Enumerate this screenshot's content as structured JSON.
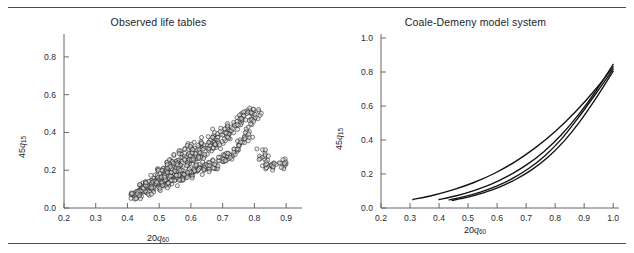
{
  "figure": {
    "caption_fragment": "",
    "top_rule": true,
    "bottom_rule": true
  },
  "panels": [
    {
      "id": "observed-life-tables",
      "title": "Observed life tables",
      "xlabel_pre": "20",
      "xlabel_var": "q",
      "xlabel_sub": "60",
      "ylabel_pre": "45",
      "ylabel_var": "q",
      "ylabel_sub": "15",
      "xticks": [
        "0.2",
        "0.3",
        "0.4",
        "0.5",
        "0.6",
        "0.7",
        "0.8",
        "0.9"
      ],
      "yticks": [
        "0.0",
        "0.2",
        "0.4",
        "0.6",
        "0.8"
      ]
    },
    {
      "id": "coale-demeny-model-system",
      "title": "Coale-Demeny model system",
      "xlabel_pre": "20",
      "xlabel_var": "q",
      "xlabel_sub": "60",
      "ylabel_pre": "45",
      "ylabel_var": "q",
      "ylabel_sub": "15",
      "xticks": [
        "0.2",
        "0.3",
        "0.4",
        "0.5",
        "0.6",
        "0.7",
        "0.8",
        "0.9",
        "1.0"
      ],
      "yticks": [
        "0.0",
        "0.2",
        "0.4",
        "0.6",
        "0.8",
        "1.0"
      ]
    }
  ],
  "chart_data": [
    {
      "type": "scatter",
      "title": "Observed life tables",
      "xlabel": "20q60",
      "ylabel": "45q15",
      "xlim": [
        0.2,
        0.95
      ],
      "ylim": [
        0.0,
        0.9
      ],
      "xticks": [
        0.2,
        0.3,
        0.4,
        0.5,
        0.6,
        0.7,
        0.8,
        0.9
      ],
      "yticks": [
        0.0,
        0.2,
        0.4,
        0.6,
        0.8
      ],
      "grid": false,
      "legend": null,
      "marker": "open-circle",
      "n_points": 620,
      "description": "Dense positively-correlated cloud of observed life-table pairs rising from about (0.42, 0.06) to about (0.80, 0.50), with a handful of outliers near x = 0.85-0.90 at y = 0.22-0.30.",
      "points_envelope": {
        "x_min": 0.41,
        "x_max": 0.9,
        "y_min": 0.05,
        "y_max": 0.53,
        "trend_slope": 0.95,
        "trend_intercept": -0.36
      },
      "points": [
        [
          0.42,
          0.07
        ],
        [
          0.43,
          0.07
        ],
        [
          0.44,
          0.08
        ],
        [
          0.44,
          0.1
        ],
        [
          0.45,
          0.08
        ],
        [
          0.45,
          0.11
        ],
        [
          0.46,
          0.09
        ],
        [
          0.46,
          0.12
        ],
        [
          0.47,
          0.1
        ],
        [
          0.47,
          0.13
        ],
        [
          0.48,
          0.11
        ],
        [
          0.48,
          0.14
        ],
        [
          0.49,
          0.11
        ],
        [
          0.49,
          0.15
        ],
        [
          0.5,
          0.12
        ],
        [
          0.5,
          0.16
        ],
        [
          0.5,
          0.2
        ],
        [
          0.51,
          0.13
        ],
        [
          0.51,
          0.17
        ],
        [
          0.52,
          0.13
        ],
        [
          0.52,
          0.18
        ],
        [
          0.52,
          0.22
        ],
        [
          0.53,
          0.14
        ],
        [
          0.53,
          0.19
        ],
        [
          0.54,
          0.15
        ],
        [
          0.54,
          0.2
        ],
        [
          0.54,
          0.24
        ],
        [
          0.55,
          0.15
        ],
        [
          0.55,
          0.21
        ],
        [
          0.55,
          0.26
        ],
        [
          0.56,
          0.16
        ],
        [
          0.56,
          0.22
        ],
        [
          0.57,
          0.17
        ],
        [
          0.57,
          0.23
        ],
        [
          0.57,
          0.28
        ],
        [
          0.58,
          0.17
        ],
        [
          0.58,
          0.24
        ],
        [
          0.59,
          0.18
        ],
        [
          0.59,
          0.25
        ],
        [
          0.59,
          0.3
        ],
        [
          0.6,
          0.19
        ],
        [
          0.6,
          0.26
        ],
        [
          0.6,
          0.32
        ],
        [
          0.61,
          0.19
        ],
        [
          0.61,
          0.27
        ],
        [
          0.62,
          0.2
        ],
        [
          0.62,
          0.28
        ],
        [
          0.62,
          0.33
        ],
        [
          0.63,
          0.21
        ],
        [
          0.63,
          0.29
        ],
        [
          0.64,
          0.21
        ],
        [
          0.64,
          0.3
        ],
        [
          0.64,
          0.35
        ],
        [
          0.65,
          0.22
        ],
        [
          0.65,
          0.31
        ],
        [
          0.66,
          0.23
        ],
        [
          0.66,
          0.32
        ],
        [
          0.66,
          0.37
        ],
        [
          0.67,
          0.23
        ],
        [
          0.67,
          0.33
        ],
        [
          0.68,
          0.24
        ],
        [
          0.68,
          0.34
        ],
        [
          0.68,
          0.39
        ],
        [
          0.69,
          0.25
        ],
        [
          0.69,
          0.35
        ],
        [
          0.7,
          0.26
        ],
        [
          0.7,
          0.36
        ],
        [
          0.7,
          0.41
        ],
        [
          0.71,
          0.27
        ],
        [
          0.71,
          0.38
        ],
        [
          0.72,
          0.28
        ],
        [
          0.72,
          0.4
        ],
        [
          0.73,
          0.29
        ],
        [
          0.73,
          0.42
        ],
        [
          0.74,
          0.31
        ],
        [
          0.74,
          0.44
        ],
        [
          0.75,
          0.33
        ],
        [
          0.75,
          0.46
        ],
        [
          0.76,
          0.35
        ],
        [
          0.76,
          0.47
        ],
        [
          0.77,
          0.37
        ],
        [
          0.77,
          0.48
        ],
        [
          0.78,
          0.4
        ],
        [
          0.78,
          0.5
        ],
        [
          0.79,
          0.44
        ],
        [
          0.8,
          0.48
        ],
        [
          0.8,
          0.51
        ],
        [
          0.81,
          0.52
        ],
        [
          0.82,
          0.29
        ],
        [
          0.83,
          0.26
        ],
        [
          0.84,
          0.24
        ],
        [
          0.85,
          0.23
        ],
        [
          0.86,
          0.22
        ],
        [
          0.88,
          0.23
        ],
        [
          0.9,
          0.23
        ]
      ]
    },
    {
      "type": "line",
      "title": "Coale-Demeny model system",
      "xlabel": "20q60",
      "ylabel": "45q15",
      "xlim": [
        0.2,
        1.02
      ],
      "ylim": [
        0.0,
        1.0
      ],
      "xticks": [
        0.2,
        0.3,
        0.4,
        0.5,
        0.6,
        0.7,
        0.8,
        0.9,
        1.0
      ],
      "yticks": [
        0.0,
        0.2,
        0.4,
        0.6,
        0.8,
        1.0
      ],
      "grid": false,
      "legend": null,
      "description": "Four convex model-system curves (Coale-Demeny West, North, East, South families) rising from low 45q15 at moderate 20q60 to roughly 0.82-0.85 at 20q60 = 1.0; the curves cross near 20q60 = 0.75-0.85.",
      "series": [
        {
          "name": "curve-1",
          "x": [
            0.31,
            0.38,
            0.45,
            0.52,
            0.59,
            0.66,
            0.73,
            0.8,
            0.87,
            0.94,
            1.0
          ],
          "y": [
            0.05,
            0.075,
            0.108,
            0.15,
            0.203,
            0.27,
            0.352,
            0.45,
            0.566,
            0.7,
            0.83
          ]
        },
        {
          "name": "curve-2",
          "x": [
            0.4,
            0.46,
            0.52,
            0.58,
            0.64,
            0.7,
            0.76,
            0.82,
            0.88,
            0.94,
            1.0
          ],
          "y": [
            0.05,
            0.072,
            0.102,
            0.14,
            0.19,
            0.252,
            0.33,
            0.428,
            0.548,
            0.688,
            0.845
          ]
        },
        {
          "name": "curve-3",
          "x": [
            0.435,
            0.49,
            0.545,
            0.6,
            0.655,
            0.71,
            0.765,
            0.82,
            0.875,
            0.94,
            1.0
          ],
          "y": [
            0.048,
            0.068,
            0.095,
            0.13,
            0.176,
            0.234,
            0.308,
            0.402,
            0.52,
            0.672,
            0.818
          ]
        },
        {
          "name": "curve-4",
          "x": [
            0.445,
            0.5,
            0.555,
            0.61,
            0.665,
            0.72,
            0.775,
            0.83,
            0.885,
            0.945,
            1.0
          ],
          "y": [
            0.045,
            0.064,
            0.09,
            0.124,
            0.169,
            0.226,
            0.299,
            0.392,
            0.508,
            0.656,
            0.805
          ]
        }
      ]
    }
  ]
}
